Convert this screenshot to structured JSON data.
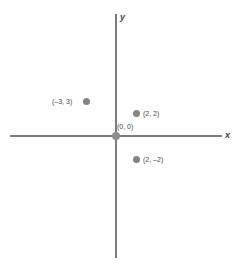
{
  "chart_data": {
    "type": "scatter",
    "title": "",
    "xlabel": "x",
    "ylabel": "y",
    "grid": false,
    "legend": null,
    "xlim": [
      -5.5,
      5.5
    ],
    "ylim": [
      -6.5,
      6.5
    ],
    "axis_labels": {
      "x": "x",
      "y": "y"
    },
    "points": [
      {
        "label": "(–3, 3)",
        "x": -3,
        "y": 3,
        "label_side": "left"
      },
      {
        "label": "(2, 2)",
        "x": 2,
        "y": 2,
        "label_side": "right"
      },
      {
        "label": "(2, –2)",
        "x": 2,
        "y": -2,
        "label_side": "right"
      },
      {
        "label": "(0, 0)",
        "x": 0,
        "y": 0,
        "label_side": "upper-right"
      }
    ],
    "colors": {
      "point": "#858585",
      "axis": "#7d7d7d",
      "text": "#4a4a4a",
      "background": "#ffffff"
    }
  }
}
